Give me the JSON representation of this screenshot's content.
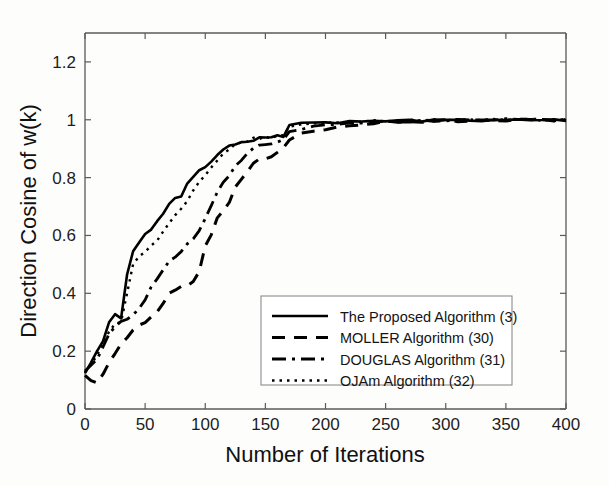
{
  "figure": {
    "background_color": "#fdfdfc",
    "axis_color": "#5a5a5a",
    "line_color": "#000000"
  },
  "chart_data": {
    "type": "line",
    "title": "",
    "xlabel": "Number of Iterations",
    "ylabel": "Direction Cosine of w(k)",
    "xlim": [
      0,
      400
    ],
    "ylim": [
      0,
      1.3
    ],
    "grid": false,
    "legend_position": "lower-center-right",
    "xticks": [
      0,
      50,
      100,
      150,
      200,
      250,
      300,
      350,
      400
    ],
    "xtick_labels": [
      "0",
      "50",
      "100",
      "150",
      "200",
      "250",
      "300",
      "350",
      "400"
    ],
    "yticks": [
      0,
      0.2,
      0.4,
      0.6,
      0.8,
      1,
      1.2
    ],
    "ytick_labels": [
      "0",
      "0.2",
      "0.4",
      "0.6",
      "0.8",
      "1",
      "1.2"
    ],
    "x": [
      0,
      5,
      10,
      15,
      20,
      25,
      30,
      35,
      40,
      45,
      50,
      55,
      60,
      65,
      70,
      75,
      80,
      85,
      90,
      95,
      100,
      105,
      110,
      115,
      120,
      125,
      130,
      135,
      140,
      145,
      150,
      155,
      160,
      165,
      170,
      180,
      190,
      200,
      210,
      220,
      230,
      240,
      250,
      260,
      270,
      280,
      290,
      300,
      310,
      320,
      330,
      340,
      350,
      360,
      370,
      380,
      390,
      400
    ],
    "series": [
      {
        "name": "The Proposed Algorithm (3)",
        "style": "solid",
        "dash": "none",
        "color": "#000000",
        "width": 2.6,
        "values": [
          0.13,
          0.16,
          0.2,
          0.24,
          0.3,
          0.33,
          0.31,
          0.46,
          0.55,
          0.58,
          0.6,
          0.62,
          0.65,
          0.68,
          0.71,
          0.73,
          0.74,
          0.78,
          0.8,
          0.82,
          0.84,
          0.86,
          0.88,
          0.9,
          0.91,
          0.92,
          0.925,
          0.93,
          0.932,
          0.935,
          0.937,
          0.94,
          0.942,
          0.945,
          0.985,
          0.986,
          0.988,
          0.99,
          0.991,
          0.992,
          0.993,
          0.995,
          0.996,
          0.996,
          0.997,
          0.997,
          0.998,
          0.998,
          0.998,
          0.999,
          0.999,
          0.999,
          0.999,
          1.0,
          1.0,
          1.0,
          0.999,
          1.0
        ]
      },
      {
        "name": "MOLLER Algorithm (30)",
        "style": "dashed",
        "dash": "13,9",
        "color": "#000000",
        "width": 3.0,
        "values": [
          0.12,
          0.095,
          0.09,
          0.12,
          0.16,
          0.19,
          0.22,
          0.25,
          0.27,
          0.285,
          0.3,
          0.315,
          0.33,
          0.36,
          0.4,
          0.415,
          0.42,
          0.42,
          0.44,
          0.47,
          0.56,
          0.6,
          0.655,
          0.68,
          0.72,
          0.77,
          0.8,
          0.82,
          0.845,
          0.86,
          0.868,
          0.875,
          0.885,
          0.9,
          0.93,
          0.95,
          0.96,
          0.97,
          0.978,
          0.982,
          0.986,
          0.99,
          0.992,
          0.993,
          0.994,
          0.995,
          0.996,
          0.997,
          0.997,
          0.998,
          0.998,
          0.999,
          0.999,
          0.999,
          1.0,
          1.0,
          0.999,
          1.0
        ]
      },
      {
        "name": "DOUGLAS Algorithm (31)",
        "style": "dash-dot",
        "dash": "14,6,3,6",
        "color": "#000000",
        "width": 2.8,
        "values": [
          0.13,
          0.15,
          0.17,
          0.21,
          0.26,
          0.29,
          0.3,
          0.305,
          0.32,
          0.35,
          0.38,
          0.42,
          0.45,
          0.48,
          0.51,
          0.53,
          0.55,
          0.575,
          0.59,
          0.62,
          0.66,
          0.7,
          0.745,
          0.78,
          0.81,
          0.84,
          0.865,
          0.885,
          0.9,
          0.91,
          0.915,
          0.92,
          0.925,
          0.93,
          0.96,
          0.97,
          0.978,
          0.983,
          0.986,
          0.989,
          0.991,
          0.993,
          0.995,
          0.996,
          0.996,
          0.997,
          0.998,
          0.998,
          0.998,
          0.999,
          0.999,
          0.999,
          1.0,
          1.0,
          1.0,
          1.0,
          0.999,
          1.0
        ]
      },
      {
        "name": "OJAm Algorithm (32)",
        "style": "dotted",
        "dash": "2.5,5",
        "color": "#000000",
        "width": 2.4,
        "values": [
          0.13,
          0.155,
          0.19,
          0.225,
          0.27,
          0.29,
          0.295,
          0.4,
          0.5,
          0.525,
          0.545,
          0.565,
          0.585,
          0.61,
          0.64,
          0.665,
          0.69,
          0.72,
          0.755,
          0.785,
          0.81,
          0.835,
          0.86,
          0.885,
          0.9,
          0.915,
          0.922,
          0.928,
          0.932,
          0.936,
          0.938,
          0.94,
          0.942,
          0.945,
          0.98,
          0.983,
          0.986,
          0.988,
          0.99,
          0.991,
          0.993,
          0.994,
          0.996,
          0.996,
          0.997,
          0.997,
          0.998,
          0.998,
          0.999,
          0.999,
          0.999,
          0.999,
          1.0,
          1.0,
          1.0,
          1.0,
          0.999,
          1.0
        ]
      }
    ]
  },
  "legend": {
    "entries": [
      {
        "label": "The Proposed Algorithm (3)",
        "style": "solid"
      },
      {
        "label": "MOLLER Algorithm (30)",
        "style": "dashed"
      },
      {
        "label": "DOUGLAS Algorithm (31)",
        "style": "dash-dot"
      },
      {
        "label": "OJAm Algorithm (32)",
        "style": "dotted"
      }
    ]
  }
}
